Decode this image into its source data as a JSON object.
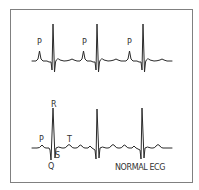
{
  "title": "NORMAL ECG",
  "colors": {
    "frame": "#808080",
    "trace": "#2a2a2a",
    "text": "#333333",
    "background": "#ffffff"
  },
  "frame": {
    "x": 10,
    "y": 9,
    "width": 183,
    "height": 174
  },
  "strips": [
    {
      "name": "upper-strip",
      "baseline_y": 61,
      "x_start": 32,
      "x_end": 172,
      "beats": [
        {
          "p_x": 40,
          "r_x": 53
        },
        {
          "p_x": 84,
          "r_x": 97
        },
        {
          "p_x": 130,
          "r_x": 143
        }
      ],
      "labels": [
        {
          "text": "P",
          "x": 37,
          "y": 45
        },
        {
          "text": "P",
          "x": 82,
          "y": 45
        },
        {
          "text": "P",
          "x": 127,
          "y": 45
        }
      ]
    },
    {
      "name": "lower-strip",
      "baseline_y": 148,
      "x_start": 32,
      "x_end": 172,
      "beats": [
        {
          "p_x": 42,
          "r_x": 53
        },
        {
          "p_x": 87,
          "r_x": 97
        },
        {
          "p_x": 131,
          "r_x": 142
        }
      ],
      "labels": [
        {
          "text": "P",
          "x": 39,
          "y": 142
        },
        {
          "text": "R",
          "x": 51,
          "y": 107
        },
        {
          "text": "T",
          "x": 67,
          "y": 142
        },
        {
          "text": "S",
          "x": 55,
          "y": 158
        },
        {
          "text": "Q",
          "x": 48,
          "y": 169
        }
      ]
    }
  ],
  "caption": {
    "text": "NORMAL ECG",
    "x": 115,
    "y": 170
  }
}
